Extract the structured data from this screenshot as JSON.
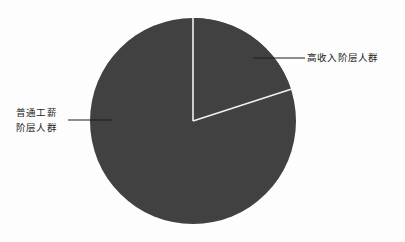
{
  "chart_data": {
    "type": "pie",
    "title": "",
    "subtitle": "",
    "xlabel": "",
    "ylabel": "",
    "grid": false,
    "legend_position": "callout-labels",
    "background_color": "#fdfdfd",
    "slice_fill_color": "#414141",
    "slice_separator_color": "#f0f0ee",
    "leader_line_color": "#1d1d1d",
    "label_color": "#1d1d1d",
    "start_angle_deg": 0,
    "direction": "clockwise",
    "categories": [
      "高收入阶层人群",
      "普通工薪阶层人群"
    ],
    "values": [
      20,
      80
    ],
    "slices": [
      {
        "label": "高收入阶层人群",
        "value": 20,
        "angle_deg": 72,
        "color": "#414141",
        "label_position": "right"
      },
      {
        "label_lines": [
          "普通工薪",
          "阶层人群"
        ],
        "label": "普通工薪阶层人群",
        "value": 80,
        "angle_deg": 288,
        "color": "#414141",
        "label_position": "left"
      }
    ]
  },
  "labels": {
    "high_income": "高收入阶层人群",
    "ordinary_wage_line1": "普通工薪",
    "ordinary_wage_line2": "阶层人群"
  }
}
